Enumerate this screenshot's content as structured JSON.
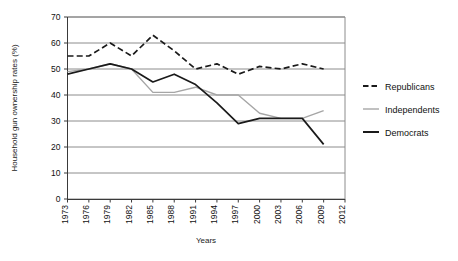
{
  "chart_data": {
    "type": "line",
    "title": "",
    "xlabel": "Years",
    "ylabel": "Household gun ownership rates (%)",
    "x": [
      1973,
      1976,
      1979,
      1982,
      1985,
      1988,
      1991,
      1994,
      1997,
      2000,
      2003,
      2006,
      2009,
      2012
    ],
    "categories": [
      "1973",
      "1976",
      "1979",
      "1982",
      "1985",
      "1988",
      "1991",
      "1994",
      "1997",
      "2000",
      "2003",
      "2006",
      "2009",
      "2012"
    ],
    "xlim": [
      1973,
      2012
    ],
    "ylim": [
      0,
      70
    ],
    "yticks": [
      0,
      10,
      20,
      30,
      40,
      50,
      60,
      70
    ],
    "ytick_labels": [
      "0",
      "10",
      "20",
      "30",
      "40",
      "50",
      "60",
      "70"
    ],
    "grid": "horizontal",
    "legend_position": "right",
    "series": [
      {
        "name": "Republicans",
        "style": "dashed",
        "color": "#1a1a1a",
        "values": [
          55,
          55,
          60,
          55,
          63,
          57,
          50,
          52,
          48,
          51,
          50,
          52,
          50,
          null
        ]
      },
      {
        "name": "Independents",
        "style": "solid",
        "color": "#a6a6a6",
        "values": [
          49,
          50,
          52,
          50,
          41,
          41,
          43,
          40,
          40,
          33,
          31,
          31,
          34,
          null
        ]
      },
      {
        "name": "Democrats",
        "style": "solid",
        "color": "#1a1a1a",
        "values": [
          48,
          50,
          52,
          50,
          45,
          48,
          44,
          37,
          29,
          31,
          31,
          31,
          21,
          null
        ]
      }
    ]
  },
  "legend": {
    "items": [
      {
        "label": "Republicans",
        "swatch": "dashed-black"
      },
      {
        "label": "Independents",
        "swatch": "solid-gray"
      },
      {
        "label": "Democrats",
        "swatch": "solid-black"
      }
    ]
  }
}
